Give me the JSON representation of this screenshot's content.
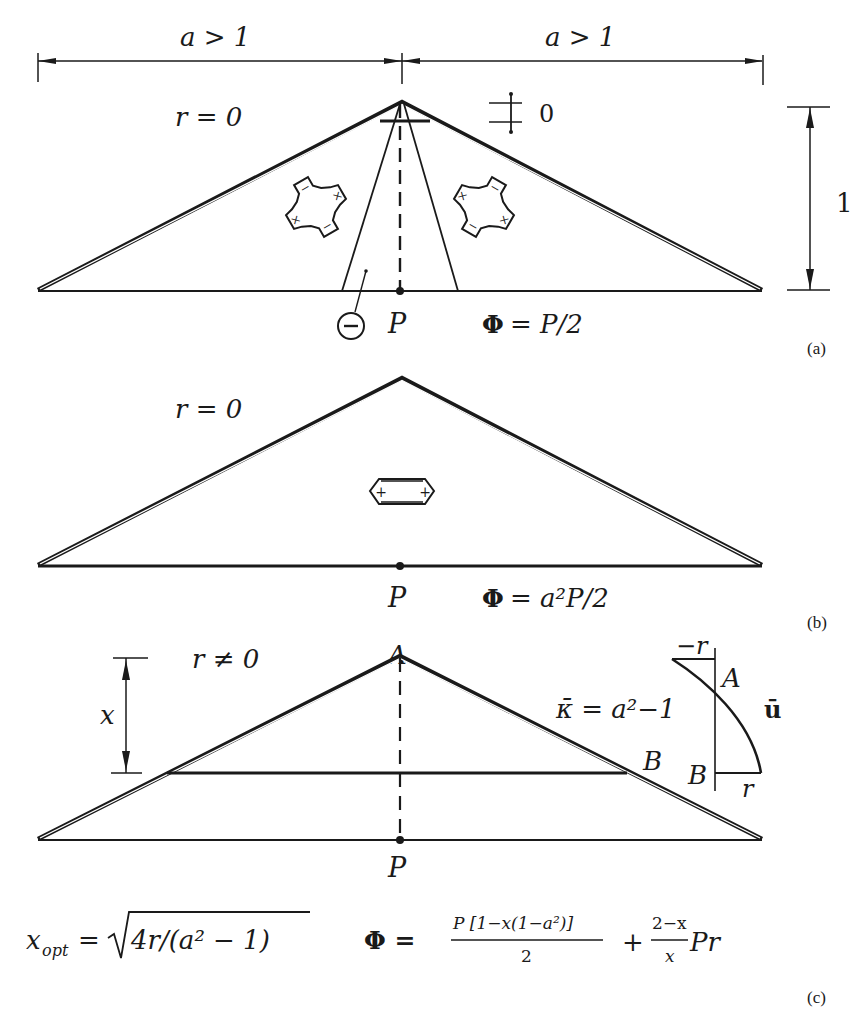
{
  "figure": {
    "panels": [
      {
        "id": "a",
        "caption": "(a)",
        "dimension_left": "a > 1",
        "dimension_right": "a > 1",
        "height_label": "1",
        "condition": "r = 0",
        "moment_symbol_label": "0",
        "load_label": "P",
        "negative_region_symbol": "−",
        "result": "Φ = P/2",
        "result_lhs": "Φ",
        "result_rhs": "= P/2",
        "left_cell_signs": [
          "×",
          "−",
          "×",
          "−"
        ],
        "right_cell_signs": [
          "−",
          "×",
          "×",
          "−"
        ]
      },
      {
        "id": "b",
        "caption": "(b)",
        "condition": "r = 0",
        "load_label": "P",
        "result": "Φ = a²P/2",
        "result_lhs": "Φ",
        "result_rhs": "= a²P/2",
        "cell_signs": [
          "+",
          "+"
        ]
      },
      {
        "id": "c",
        "caption": "(c)",
        "condition": "r ≠ 0",
        "dimension_label": "x",
        "apex_label": "A",
        "tie_end_label": "B",
        "load_label": "P",
        "curvature_label": "κ̄ = a²−1",
        "displacement_label": "ū",
        "diagram_top_value": "−r",
        "diagram_top_point": "A",
        "diagram_bottom_point": "B",
        "diagram_bottom_value": "r",
        "optimum_formula": "x_opt = √(4r/(a² − 1))",
        "optimum_lhs": "x",
        "optimum_sub": "opt",
        "optimum_rhs": "= √4r/(a² − 1)",
        "optimum_eq": "=",
        "optimum_root": "4r/(a² − 1)",
        "objective_formula": "Φ = P[1−x(1−a²)]/2 + (2−x)/x · Pr",
        "objective_lhs": "Φ =",
        "objective_frac1_num": "P  [1−x(1−a²)]",
        "objective_frac1_den": "2",
        "objective_plus": "+",
        "objective_frac2_num": "2−x",
        "objective_frac2_den": "x",
        "objective_tail": "Pr"
      }
    ]
  }
}
